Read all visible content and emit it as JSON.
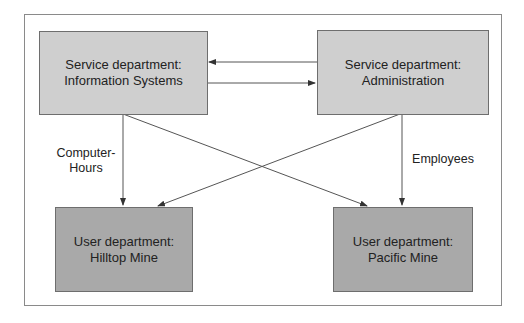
{
  "diagram": {
    "nodes": {
      "is": {
        "line1": "Service department:",
        "line2": "Information Systems"
      },
      "admin": {
        "line1": "Service department:",
        "line2": "Administration"
      },
      "hilltop": {
        "line1": "User department:",
        "line2": "Hilltop Mine"
      },
      "pacific": {
        "line1": "User department:",
        "line2": "Pacific Mine"
      }
    },
    "labels": {
      "computer_hours_1": "Computer-",
      "computer_hours_2": "Hours",
      "employees": "Employees"
    },
    "colors": {
      "service_fill": "#cfcfcf",
      "user_fill": "#a9a9a9",
      "line": "#555555"
    }
  }
}
